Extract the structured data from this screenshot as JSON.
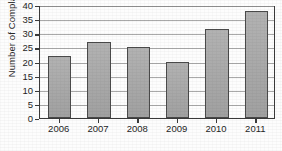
{
  "chart_data": {
    "type": "bar",
    "title": "",
    "xlabel": "",
    "ylabel": "Number of Complaints",
    "categories": [
      "2006",
      "2007",
      "2008",
      "2009",
      "2010",
      "2011"
    ],
    "values": [
      22,
      27,
      25,
      20,
      31.5,
      38
    ],
    "ylim": [
      0,
      40
    ],
    "ytick_labels": [
      "0",
      "5",
      "10",
      "15",
      "20",
      "25",
      "30",
      "35",
      "40"
    ],
    "ytick_values": [
      0,
      5,
      10,
      15,
      20,
      25,
      30,
      35,
      40
    ],
    "grid": "horizontal",
    "legend": "none",
    "bar_color": "#a9a9a9",
    "bar_border_color": "#4a4a4a",
    "gridline_color": "#9a9a9a",
    "axis_color": "#3a3a3a",
    "background_color": "#fdfdfd"
  }
}
